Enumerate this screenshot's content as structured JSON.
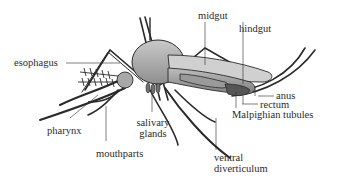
{
  "diagram": {
    "labels": {
      "esophagus": "esophagus",
      "midgut": "midgut",
      "hindgut": "hindgut",
      "anus": "anus",
      "rectum": "rectum",
      "malpighian_tubules": "Malpighian tubules",
      "pharynx": "pharynx",
      "mouthparts": "mouthparts",
      "salivary_glands_line1": "salivary",
      "salivary_glands_line2": "glands",
      "ventral_diverticulum_line1": "ventral",
      "ventral_diverticulum_line2": "diverticulum"
    },
    "colors": {
      "ink": "#2a2a2a",
      "body_fill": "#b8b8b8",
      "body_dark": "#8a8a8a",
      "gut_fill": "#9a9a9a",
      "background": "#ffffff"
    }
  }
}
